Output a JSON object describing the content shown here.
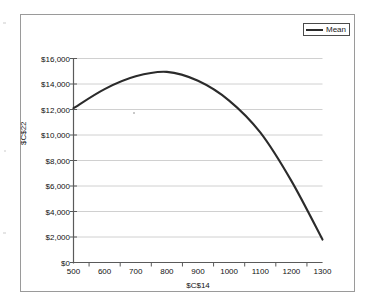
{
  "chart_data": {
    "type": "line",
    "title": "",
    "subtitle": "",
    "xlabel": "$C$14",
    "ylabel": "$C$22",
    "xlim": [
      500,
      1300
    ],
    "ylim": [
      0,
      16000
    ],
    "grid": true,
    "legend_position": "top-right",
    "x_tick_labels": [
      "500",
      "600",
      "700",
      "800",
      "900",
      "1000",
      "1100",
      "1200",
      "1300"
    ],
    "x_ticks": [
      500,
      600,
      700,
      800,
      900,
      1000,
      1100,
      1200,
      1300
    ],
    "y_tick_labels": [
      "$0",
      "$2,000",
      "$4,000",
      "$6,000",
      "$8,000",
      "$10,000",
      "$12,000",
      "$14,000",
      "$16,000"
    ],
    "y_ticks": [
      0,
      2000,
      4000,
      6000,
      8000,
      10000,
      12000,
      14000,
      16000
    ],
    "x": [
      500,
      600,
      700,
      800,
      900,
      1000,
      1100,
      1200,
      1300
    ],
    "series": [
      {
        "name": "Mean",
        "color": "#2b2b2b",
        "values": [
          12100,
          13600,
          14600,
          14950,
          14250,
          12700,
          10200,
          6400,
          1800
        ]
      }
    ]
  },
  "legend": {
    "entries": [
      {
        "label": "Mean",
        "color": "#2b2b2b"
      }
    ]
  },
  "colors": {
    "series_line": "#2b2b2b",
    "gridline": "#d0d0d0",
    "axis": "#5a5a5a",
    "frame_border": "#9a9a9a",
    "background": "#ffffff",
    "text": "#111111"
  }
}
